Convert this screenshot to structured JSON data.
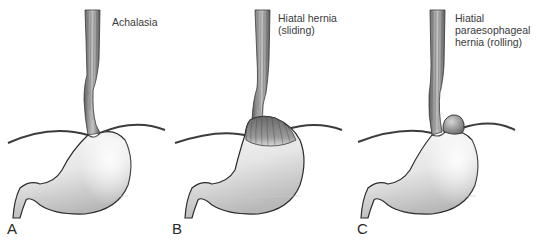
{
  "figure": {
    "panels": [
      {
        "letter": "A",
        "caption": "Achalasia",
        "condition": "achalasia"
      },
      {
        "letter": "B",
        "caption": "Hiatal hernia\n(sliding)",
        "condition": "sliding-hiatal-hernia"
      },
      {
        "letter": "C",
        "caption": "Hiatial\nparaesophageal\nhernia (rolling)",
        "condition": "rolling-paraesophageal-hernia"
      }
    ],
    "colors": {
      "background": "#ffffff",
      "outline": "#2b2b2b",
      "stomach_fill_light": "#f4f4f4",
      "stomach_fill_dark": "#bdbdbd",
      "esophagus_fill": "#8a8a8a",
      "diaphragm": "#3c3c3c",
      "text": "#3a3a3a"
    }
  }
}
